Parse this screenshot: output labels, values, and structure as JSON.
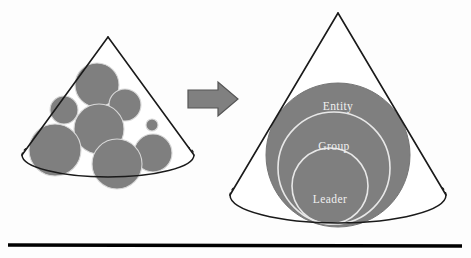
{
  "diagram": {
    "colors": {
      "sphere_fill": "#7f7f7f",
      "sphere_stroke": "#6f6f6f",
      "cone_outline": "#1a1a1a",
      "arrow_fill": "#808080",
      "arrow_stroke": "#555555",
      "label_color": "#f0f0f0",
      "baseline_color": "#000000",
      "background": "#fdfdfd"
    },
    "left_cone": {
      "name": "unstructured-spheres-cone",
      "apex": {
        "x": 108,
        "y": 37
      },
      "base_center": {
        "x": 108,
        "y": 155
      },
      "base_rx": 86,
      "base_ry": 22,
      "spheres": [
        {
          "id": "sphere-1",
          "cx": 97,
          "cy": 85,
          "r": 22
        },
        {
          "id": "sphere-2",
          "cx": 64,
          "cy": 110,
          "r": 14
        },
        {
          "id": "sphere-3",
          "cx": 125,
          "cy": 105,
          "r": 16
        },
        {
          "id": "sphere-4",
          "cx": 99,
          "cy": 129,
          "r": 25
        },
        {
          "id": "sphere-5",
          "cx": 55,
          "cy": 150,
          "r": 26
        },
        {
          "id": "sphere-6",
          "cx": 117,
          "cy": 164,
          "r": 25
        },
        {
          "id": "sphere-7",
          "cx": 153,
          "cy": 153,
          "r": 19
        },
        {
          "id": "sphere-8",
          "cx": 152,
          "cy": 125,
          "r": 6
        }
      ]
    },
    "arrow": {
      "name": "transformation-arrow",
      "label": "transforms into",
      "direction": "right",
      "x": 188,
      "y": 82,
      "width": 50,
      "height": 34
    },
    "right_cone": {
      "name": "structured-hierarchy-cone",
      "apex": {
        "x": 338,
        "y": 13
      },
      "base_center": {
        "x": 338,
        "y": 195
      },
      "base_rx": 108,
      "base_ry": 28,
      "layers": [
        {
          "id": "layer-entity",
          "label": "Entity",
          "cx": 338,
          "cy": 155,
          "r": 72,
          "label_x": 338,
          "label_y": 110,
          "filled": true
        },
        {
          "id": "layer-group",
          "label": "Group",
          "cx": 334,
          "cy": 168,
          "r": 56,
          "label_x": 334,
          "label_y": 150,
          "filled": false
        },
        {
          "id": "layer-leader",
          "label": "Leader",
          "cx": 330,
          "cy": 186,
          "r": 38,
          "label_x": 330,
          "label_y": 203,
          "filled": false
        }
      ]
    },
    "baseline": {
      "name": "ground-baseline",
      "x1": 8,
      "y1": 245,
      "x2": 462,
      "y2": 246,
      "thickness": 3.4
    }
  }
}
